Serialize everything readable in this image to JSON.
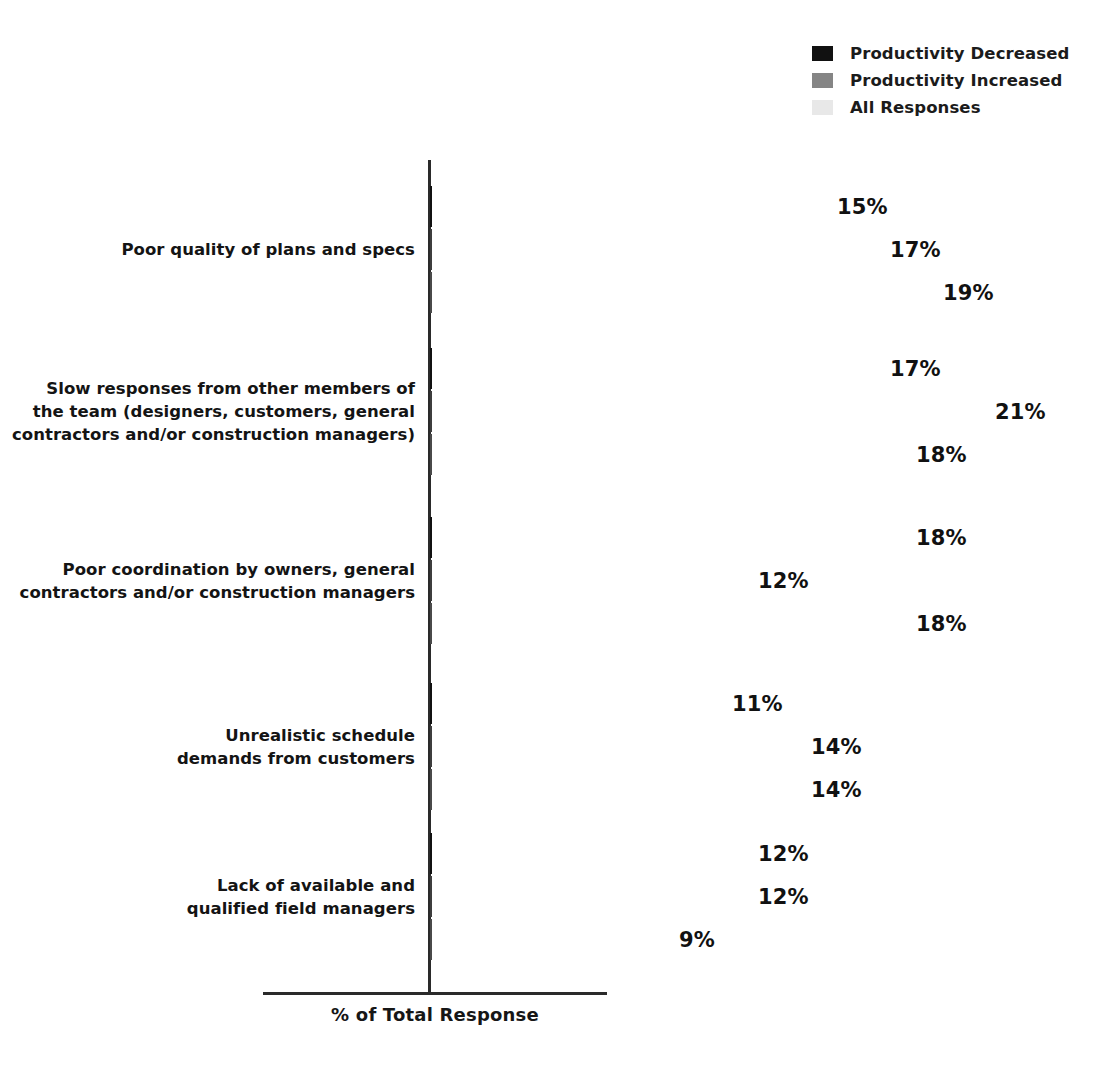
{
  "chart_data": {
    "type": "bar",
    "orientation": "horizontal",
    "title": "",
    "xlabel": "% of Total Response",
    "ylabel": "",
    "xlim": [
      0,
      25
    ],
    "grid": false,
    "legend_position": "top-right",
    "value_suffix": "%",
    "categories": [
      "Poor quality of plans and specs",
      "Slow responses from other members of the team (designers, customers, general contractors and/or construction managers)",
      "Poor coordination by owners, general contractors and/or construction managers",
      "Unrealistic schedule demands from customers",
      "Lack of available and qualified field managers"
    ],
    "category_lines": [
      [
        "Poor quality of plans and specs"
      ],
      [
        "Slow responses from other members of",
        "the team (designers, customers, general",
        "contractors and/or construction managers)"
      ],
      [
        "Poor coordination by owners, general",
        "contractors and/or construction managers"
      ],
      [
        "Unrealistic schedule",
        "demands from customers"
      ],
      [
        "Lack of available and",
        "qualified field managers"
      ]
    ],
    "series": [
      {
        "name": "Productivity Decreased",
        "color": "#111111",
        "values": [
          15,
          17,
          18,
          11,
          12
        ],
        "labels": [
          "15%",
          "17%",
          "18%",
          "11%",
          "12%"
        ]
      },
      {
        "name": "Productivity Increased",
        "color": "#858585",
        "values": [
          17,
          21,
          12,
          14,
          12
        ],
        "labels": [
          "17%",
          "21%",
          "12%",
          "14%",
          "12%"
        ]
      },
      {
        "name": "All Responses",
        "color": "#e4e4e4",
        "values": [
          19,
          18,
          18,
          14,
          9
        ],
        "labels": [
          "19%",
          "18%",
          "18%",
          "14%",
          "9%"
        ]
      }
    ]
  },
  "legend": {
    "items": [
      {
        "label": "Productivity Decreased",
        "color": "#111111"
      },
      {
        "label": "Productivity Increased",
        "color": "#858585"
      },
      {
        "label": "All Responses",
        "color": "#e8e8e8"
      }
    ]
  },
  "axis": {
    "x_title": "% of Total Response"
  }
}
